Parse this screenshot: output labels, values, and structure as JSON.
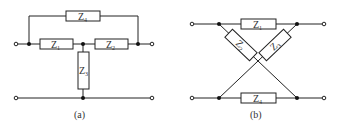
{
  "figure": {
    "diagram_a": {
      "caption": "(a)",
      "elements": [
        {
          "id": "Z4",
          "symbol": "Z",
          "sub": "4"
        },
        {
          "id": "Z1",
          "symbol": "Z",
          "sub": "1"
        },
        {
          "id": "Z2",
          "symbol": "Z",
          "sub": "2"
        },
        {
          "id": "Z3",
          "symbol": "Z",
          "sub": "3"
        }
      ]
    },
    "diagram_b": {
      "caption": "(b)",
      "elements": [
        {
          "id": "Z1",
          "symbol": "Z",
          "sub": "1"
        },
        {
          "id": "Z2",
          "symbol": "Z",
          "sub": "2"
        },
        {
          "id": "Z3",
          "symbol": "Z",
          "sub": "3"
        },
        {
          "id": "Z4",
          "symbol": "Z",
          "sub": "4"
        }
      ]
    },
    "colors": {
      "line": "#222222",
      "node": "#111111",
      "background": "#ffffff"
    }
  }
}
